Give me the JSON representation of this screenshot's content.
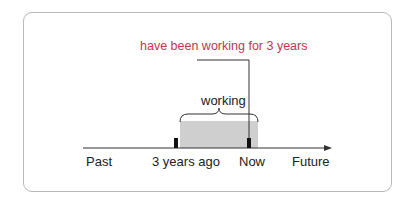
{
  "diagram": {
    "annotation": "have been working for 3 years",
    "span_label": "working",
    "timeline": {
      "labels": [
        "Past",
        "3 years ago",
        "Now",
        "Future"
      ]
    },
    "colors": {
      "annotation": "#c8334f",
      "span_fill": "#cfcfcf",
      "line": "#222222",
      "frame": "#b9b9b9"
    }
  }
}
